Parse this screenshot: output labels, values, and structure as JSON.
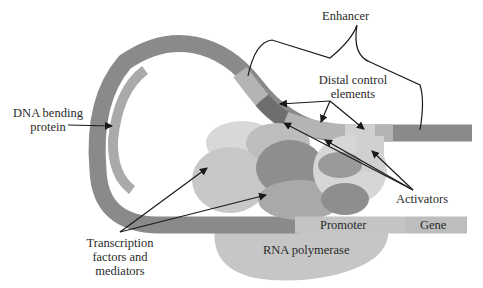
{
  "diagram": {
    "labels": {
      "enhancer": "Enhancer",
      "distal_control_elements_line1": "Distal control",
      "distal_control_elements_line2": "elements",
      "dna_bending_protein_line1": "DNA bending",
      "dna_bending_protein_line2": "protein",
      "activators": "Activators",
      "promoter": "Promoter",
      "gene": "Gene",
      "rna_polymerase": "RNA polymerase",
      "transcription_factors_line1": "Transcription",
      "transcription_factors_line2": "factors and",
      "transcription_factors_line3": "mediators"
    },
    "colors": {
      "dna_strand": "#8a8a8a",
      "dna_bending_protein": "#aaaaaa",
      "distal_element_dark": "#6e6e6e",
      "distal_element_mid": "#b4b4b4",
      "distal_element_light": "#d0d0d0",
      "promoter": "#c4c4c4",
      "gene": "#bdbdbd",
      "rna_polymerase": "#c6c6c6",
      "protein_light": "#d8d8d8",
      "protein_mid": "#bfbfbf",
      "protein_dark": "#8e8e8e",
      "arrow": "#1a1a1a"
    }
  }
}
